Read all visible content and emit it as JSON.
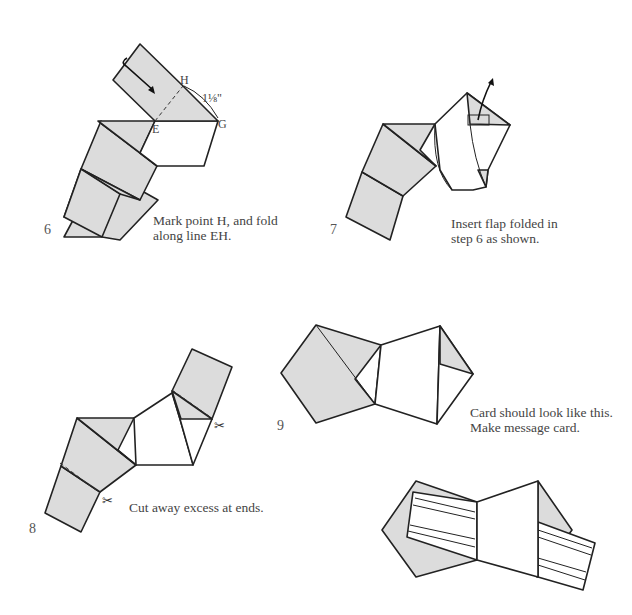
{
  "steps": [
    {
      "number": "6",
      "caption_line1": "Mark point H, and fold",
      "caption_line2": "along line EH.",
      "labels": {
        "H": "H",
        "E": "E",
        "G": "G",
        "measure": "1⅛\""
      },
      "icons": [
        "fold-arrow-icon"
      ]
    },
    {
      "number": "7",
      "caption_line1": "Insert flap folded in",
      "caption_line2": "step 6 as shown.",
      "icons": [
        "insert-arrow-icon"
      ]
    },
    {
      "number": "8",
      "caption_line1": "Cut away excess at ends.",
      "icons": [
        "scissors-icon",
        "scissors-icon"
      ]
    },
    {
      "number": "9",
      "caption_line1": "Card should look like this.",
      "caption_line2": "Make message card."
    }
  ],
  "colors": {
    "paper_fill": "#dcdcdc",
    "line": "#222222",
    "background": "#ffffff"
  }
}
